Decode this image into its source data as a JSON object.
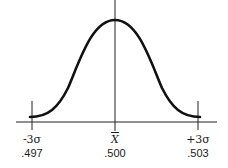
{
  "diagram": {
    "type": "normal-distribution-curve",
    "stroke_color": "#111111",
    "axis_color": "#222222",
    "markers": [
      {
        "id": "minus-3-sigma",
        "symbol": "-3σ",
        "value": ".497"
      },
      {
        "id": "mean",
        "symbol": "X",
        "value": ".500"
      },
      {
        "id": "plus-3-sigma",
        "symbol": "+3σ",
        "value": ".503"
      }
    ]
  }
}
